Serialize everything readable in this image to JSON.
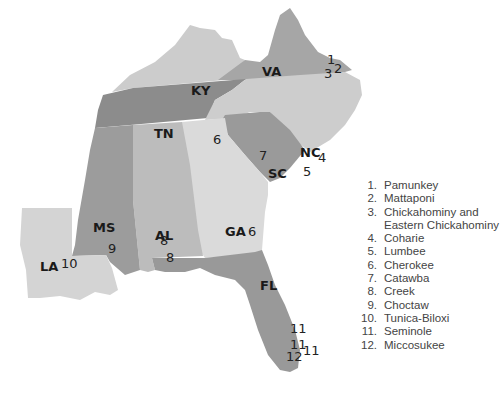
{
  "map": {
    "states": [
      {
        "code": "VA",
        "fill": "#a6a6a6"
      },
      {
        "code": "KY",
        "fill": "#cccccc"
      },
      {
        "code": "TN",
        "fill": "#8c8c8c"
      },
      {
        "code": "NC",
        "fill": "#cdcdcd"
      },
      {
        "code": "SC",
        "fill": "#9a9a9a"
      },
      {
        "code": "GA",
        "fill": "#dadada"
      },
      {
        "code": "AL",
        "fill": "#bcbcbc"
      },
      {
        "code": "MS",
        "fill": "#9c9c9c"
      },
      {
        "code": "LA",
        "fill": "#d4d4d4"
      },
      {
        "code": "FL",
        "fill": "#999999"
      }
    ],
    "markers": [
      {
        "num": "1",
        "state": "VA"
      },
      {
        "num": "2",
        "state": "VA"
      },
      {
        "num": "3",
        "state": "VA"
      },
      {
        "num": "4",
        "state": "NC"
      },
      {
        "num": "5",
        "state": "NC"
      },
      {
        "num": "6",
        "state": "NC"
      },
      {
        "num": "6",
        "state": "GA"
      },
      {
        "num": "7",
        "state": "SC"
      },
      {
        "num": "8",
        "state": "AL"
      },
      {
        "num": "8",
        "state": "AL"
      },
      {
        "num": "9",
        "state": "MS"
      },
      {
        "num": "10",
        "state": "LA"
      },
      {
        "num": "11",
        "state": "FL"
      },
      {
        "num": "11",
        "state": "FL"
      },
      {
        "num": "11",
        "state": "FL"
      },
      {
        "num": "12",
        "state": "FL"
      }
    ]
  },
  "legend": [
    {
      "num": "1.",
      "name": "Pamunkey"
    },
    {
      "num": "2.",
      "name": "Mattaponi"
    },
    {
      "num": "3.",
      "name": "Chickahominy and Eastern Chickahominy"
    },
    {
      "num": "4.",
      "name": "Coharie"
    },
    {
      "num": "5.",
      "name": "Lumbee"
    },
    {
      "num": "6.",
      "name": "Cherokee"
    },
    {
      "num": "7.",
      "name": "Catawba"
    },
    {
      "num": "8.",
      "name": "Creek"
    },
    {
      "num": "9.",
      "name": "Choctaw"
    },
    {
      "num": "10.",
      "name": "Tunica-Biloxi"
    },
    {
      "num": "11.",
      "name": "Seminole"
    },
    {
      "num": "12.",
      "name": "Miccosukee"
    }
  ]
}
